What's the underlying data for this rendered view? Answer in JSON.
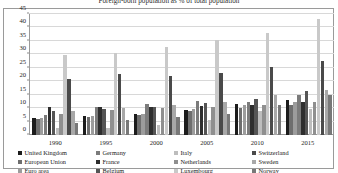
{
  "chart_data": {
    "type": "bar",
    "title": "Foreign-born population as % of total population",
    "xlabel": "",
    "ylabel": "",
    "ylim": [
      0,
      45
    ],
    "yticks": [
      0,
      5,
      10,
      15,
      20,
      25,
      30,
      35,
      40,
      45
    ],
    "grid": true,
    "legend_position": "bottom",
    "categories": [
      "1990",
      "1995",
      "2000",
      "2005",
      "2010",
      "2015"
    ],
    "series": [
      {
        "name": "United Kingdom",
        "color": "#1c1c1c",
        "values": [
          6.4,
          7.2,
          7.9,
          9.4,
          11.5,
          13.2
        ]
      },
      {
        "name": "European Union",
        "color": "#6e6e6e",
        "values": [
          5.9,
          6.6,
          7.3,
          8.8,
          9.9,
          11.3
        ]
      },
      {
        "name": "Euro area",
        "color": "#9c9c9c",
        "values": [
          6.2,
          7.1,
          8.0,
          9.6,
          11.0,
          12.3
        ]
      },
      {
        "name": "Germany",
        "color": "#7b7b7b",
        "values": [
          7.5,
          10.5,
          11.6,
          12.7,
          12.1,
          14.9
        ]
      },
      {
        "name": "France",
        "color": "#2e2e2e",
        "values": [
          10.4,
          10.3,
          10.4,
          10.9,
          11.2,
          12.1
        ]
      },
      {
        "name": "Belgium",
        "color": "#555555",
        "values": [
          8.9,
          9.5,
          10.3,
          11.8,
          13.4,
          16.3
        ]
      },
      {
        "name": "Italy",
        "color": "#bdbdbd",
        "values": [
          2.5,
          2.6,
          3.7,
          5.4,
          9.0,
          9.7
        ]
      },
      {
        "name": "Netherlands",
        "color": "#8f8f8f",
        "values": [
          7.9,
          9.2,
          10.1,
          10.6,
          11.2,
          12.1
        ]
      },
      {
        "name": "Luxembourg",
        "color": "#c9c9c9",
        "values": [
          29.8,
          30.4,
          32.6,
          35.2,
          38.1,
          43.3
        ]
      },
      {
        "name": "Switzerland",
        "color": "#4a4a4a",
        "values": [
          20.8,
          22.6,
          21.9,
          23.1,
          25.3,
          27.4
        ]
      },
      {
        "name": "Sweden",
        "color": "#a8a8a8",
        "values": [
          9.1,
          10.2,
          11.3,
          12.4,
          14.8,
          16.8
        ]
      },
      {
        "name": "Norway",
        "color": "#787878",
        "values": [
          4.5,
          5.5,
          6.8,
          7.9,
          11.2,
          14.9
        ]
      }
    ]
  },
  "legend": {
    "items": [
      "United Kingdom",
      "European Union",
      "Euro area",
      "Germany",
      "France",
      "Belgium",
      "Italy",
      "Netherlands",
      "Luxembourg",
      "Switzerland",
      "Sweden",
      "Norway"
    ]
  }
}
